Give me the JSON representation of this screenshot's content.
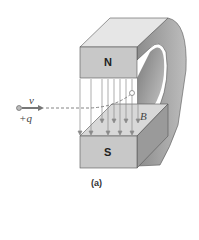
{
  "figure": {
    "caption": "(a)",
    "north_label": "N",
    "south_label": "S",
    "velocity_label": "v",
    "charge_label": "+q",
    "field_label": "B"
  },
  "colors": {
    "magnet_front": "#c8c8c8",
    "magnet_top": "#e6e6e6",
    "magnet_side": "#9a9a9a",
    "field_lines": "#8a8a8a",
    "trajectory": "#777777"
  }
}
